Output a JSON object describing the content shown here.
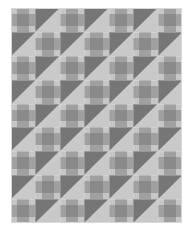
{
  "image": {
    "title": "Patchwork quilt pattern",
    "kind": "quilt-pattern-swatch",
    "width_px": 193,
    "height_px": 234,
    "background_color": "#ffffff"
  },
  "quilt": {
    "label": "Quilt block layout",
    "columns": 7,
    "rows": 9,
    "origin_x_px": 11,
    "origin_y_px": 8,
    "width_px": 171,
    "height_px": 215,
    "cell_width_px": 24.43,
    "cell_height_px": 23.89,
    "block_types": {
      "patch": "nine-patch plaid block",
      "tri": "half-square triangle block"
    },
    "triangle_orientation": "dark upper-left / light lower-right",
    "colors": {
      "light": "#c6c6c6",
      "mid": "#a0a0a0",
      "dark": "#8a8a8a",
      "triangle_dark": "#767676",
      "triangle_light": "#c9c9c9",
      "seam": "#d8d8d8",
      "canvas": "#ffffff"
    },
    "patch_matrix": [
      [
        "light",
        "mid",
        "mid",
        "light"
      ],
      [
        "mid",
        "dark",
        "dark",
        "mid"
      ],
      [
        "mid",
        "dark",
        "dark",
        "mid"
      ],
      [
        "light",
        "mid",
        "mid",
        "light"
      ]
    ],
    "layout": [
      [
        "patch",
        "tri",
        "patch",
        "tri",
        "patch",
        "tri",
        "patch"
      ],
      [
        "tri",
        "patch",
        "tri",
        "patch",
        "tri",
        "patch",
        "tri"
      ],
      [
        "patch",
        "tri",
        "patch",
        "tri",
        "patch",
        "tri",
        "patch"
      ],
      [
        "tri",
        "patch",
        "tri",
        "patch",
        "tri",
        "patch",
        "tri"
      ],
      [
        "patch",
        "tri",
        "patch",
        "tri",
        "patch",
        "tri",
        "patch"
      ],
      [
        "tri",
        "patch",
        "tri",
        "patch",
        "tri",
        "patch",
        "tri"
      ],
      [
        "patch",
        "tri",
        "patch",
        "tri",
        "patch",
        "tri",
        "patch"
      ],
      [
        "tri",
        "patch",
        "tri",
        "patch",
        "tri",
        "patch",
        "tri"
      ],
      [
        "patch",
        "tri",
        "patch",
        "tri",
        "patch",
        "tri",
        "patch"
      ]
    ]
  }
}
